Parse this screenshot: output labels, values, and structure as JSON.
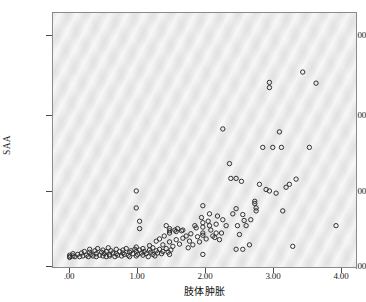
{
  "chart_data": {
    "type": "scatter",
    "title": "",
    "xlabel": "肢体肿胀",
    "ylabel": "SAA",
    "xlim": [
      -0.25,
      4.3
    ],
    "ylim": [
      -12,
      332
    ],
    "grid": false,
    "legend": null,
    "marker": "open-circle",
    "marker_color": "#303030",
    "xticks": [
      0,
      1,
      2,
      3,
      4
    ],
    "xtick_labels": [
      ".00",
      "1.00",
      "2.00",
      "3.00",
      "4.00"
    ],
    "yticks": [
      0,
      100,
      200,
      300
    ],
    "ytick_labels": [
      ".00",
      "100.00",
      "200.00",
      "300.00"
    ],
    "points": [
      [
        0.0,
        2
      ],
      [
        0.0,
        4
      ],
      [
        0.0,
        1
      ],
      [
        0.05,
        3
      ],
      [
        0.05,
        6
      ],
      [
        0.08,
        2
      ],
      [
        0.12,
        5
      ],
      [
        0.15,
        2
      ],
      [
        0.18,
        7
      ],
      [
        0.2,
        3
      ],
      [
        0.22,
        9
      ],
      [
        0.25,
        4
      ],
      [
        0.28,
        2
      ],
      [
        0.3,
        8
      ],
      [
        0.3,
        12
      ],
      [
        0.32,
        5
      ],
      [
        0.35,
        3
      ],
      [
        0.38,
        10
      ],
      [
        0.4,
        6
      ],
      [
        0.4,
        2
      ],
      [
        0.42,
        13
      ],
      [
        0.45,
        4
      ],
      [
        0.48,
        8
      ],
      [
        0.5,
        3
      ],
      [
        0.5,
        11
      ],
      [
        0.52,
        6
      ],
      [
        0.55,
        2
      ],
      [
        0.55,
        9
      ],
      [
        0.58,
        14
      ],
      [
        0.6,
        5
      ],
      [
        0.6,
        3
      ],
      [
        0.62,
        10
      ],
      [
        0.65,
        7
      ],
      [
        0.68,
        2
      ],
      [
        0.7,
        12
      ],
      [
        0.7,
        6
      ],
      [
        0.72,
        4
      ],
      [
        0.75,
        9
      ],
      [
        0.78,
        3
      ],
      [
        0.8,
        11
      ],
      [
        0.8,
        7
      ],
      [
        0.82,
        5
      ],
      [
        0.85,
        13
      ],
      [
        0.88,
        4
      ],
      [
        0.9,
        8
      ],
      [
        0.9,
        2
      ],
      [
        0.92,
        10
      ],
      [
        0.95,
        6
      ],
      [
        0.98,
        12
      ],
      [
        1.0,
        3
      ],
      [
        1.0,
        9
      ],
      [
        1.0,
        15
      ],
      [
        1.0,
        68
      ],
      [
        1.0,
        91
      ],
      [
        1.02,
        5
      ],
      [
        1.05,
        11
      ],
      [
        1.05,
        40
      ],
      [
        1.05,
        50
      ],
      [
        1.08,
        7
      ],
      [
        1.1,
        13
      ],
      [
        1.1,
        4
      ],
      [
        1.12,
        9
      ],
      [
        1.15,
        6
      ],
      [
        1.18,
        2
      ],
      [
        1.2,
        11
      ],
      [
        1.2,
        17
      ],
      [
        1.22,
        8
      ],
      [
        1.25,
        5
      ],
      [
        1.25,
        14
      ],
      [
        1.28,
        3
      ],
      [
        1.3,
        10
      ],
      [
        1.3,
        23
      ],
      [
        1.32,
        7
      ],
      [
        1.35,
        26
      ],
      [
        1.35,
        12
      ],
      [
        1.38,
        6
      ],
      [
        1.4,
        18
      ],
      [
        1.4,
        9
      ],
      [
        1.42,
        30
      ],
      [
        1.45,
        13
      ],
      [
        1.45,
        44
      ],
      [
        1.48,
        8
      ],
      [
        1.5,
        5
      ],
      [
        1.5,
        22
      ],
      [
        1.5,
        34
      ],
      [
        1.5,
        37
      ],
      [
        1.5,
        40
      ],
      [
        1.52,
        11
      ],
      [
        1.55,
        16
      ],
      [
        1.58,
        38
      ],
      [
        1.6,
        36
      ],
      [
        1.6,
        25
      ],
      [
        1.62,
        40
      ],
      [
        1.65,
        19
      ],
      [
        1.68,
        37
      ],
      [
        1.7,
        38
      ],
      [
        1.7,
        27
      ],
      [
        1.75,
        30
      ],
      [
        1.78,
        14
      ],
      [
        1.8,
        23
      ],
      [
        1.82,
        33
      ],
      [
        1.85,
        18
      ],
      [
        1.88,
        44
      ],
      [
        1.9,
        41
      ],
      [
        1.92,
        29
      ],
      [
        1.95,
        22
      ],
      [
        1.98,
        55
      ],
      [
        2.0,
        5
      ],
      [
        2.0,
        34
      ],
      [
        2.0,
        48
      ],
      [
        2.0,
        42
      ],
      [
        2.0,
        31
      ],
      [
        2.0,
        71
      ],
      [
        2.05,
        26
      ],
      [
        2.08,
        50
      ],
      [
        2.1,
        44
      ],
      [
        2.1,
        60
      ],
      [
        2.12,
        38
      ],
      [
        2.15,
        30
      ],
      [
        2.18,
        28
      ],
      [
        2.2,
        46
      ],
      [
        2.2,
        34
      ],
      [
        2.22,
        57
      ],
      [
        2.25,
        25
      ],
      [
        2.28,
        34
      ],
      [
        2.3,
        52
      ],
      [
        2.3,
        175
      ],
      [
        2.35,
        44
      ],
      [
        2.4,
        128
      ],
      [
        2.42,
        108
      ],
      [
        2.45,
        60
      ],
      [
        2.5,
        12
      ],
      [
        2.5,
        108
      ],
      [
        2.5,
        67
      ],
      [
        2.52,
        44
      ],
      [
        2.55,
        32
      ],
      [
        2.58,
        104
      ],
      [
        2.6,
        12
      ],
      [
        2.6,
        59
      ],
      [
        2.62,
        51
      ],
      [
        2.65,
        44
      ],
      [
        2.7,
        18
      ],
      [
        2.72,
        52
      ],
      [
        2.78,
        74
      ],
      [
        2.78,
        77
      ],
      [
        2.8,
        64
      ],
      [
        2.8,
        68
      ],
      [
        2.85,
        100
      ],
      [
        2.9,
        150
      ],
      [
        2.95,
        93
      ],
      [
        3.0,
        231
      ],
      [
        3.0,
        238
      ],
      [
        3.0,
        91
      ],
      [
        3.05,
        150
      ],
      [
        3.1,
        88
      ],
      [
        3.15,
        171
      ],
      [
        3.18,
        150
      ],
      [
        3.2,
        64
      ],
      [
        3.25,
        96
      ],
      [
        3.3,
        100
      ],
      [
        3.35,
        16
      ],
      [
        3.4,
        107
      ],
      [
        3.5,
        252
      ],
      [
        3.6,
        150
      ],
      [
        3.7,
        237
      ],
      [
        4.0,
        44
      ]
    ]
  },
  "axes": {
    "ylabel_text": "SAA",
    "xlabel_text": "肢体肿胀"
  }
}
